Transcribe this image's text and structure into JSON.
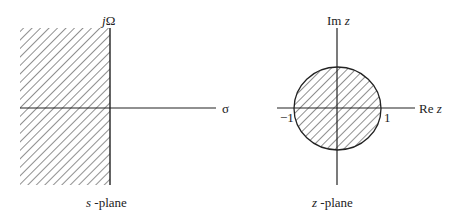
{
  "diagram": {
    "s_plane": {
      "caption_var": "s",
      "caption_text": " -plane",
      "vertical_axis_label_j": "j",
      "vertical_axis_label_omega": "Ω",
      "horizontal_axis_label": "σ",
      "shaded_region": "left half-plane"
    },
    "z_plane": {
      "caption_var": "z",
      "caption_text": " -plane",
      "vertical_axis_label_prefix": "Im ",
      "vertical_axis_label_var": "z",
      "horizontal_axis_label_prefix": "Re ",
      "horizontal_axis_label_var": "z",
      "tick_neg": "−1",
      "tick_pos": "1",
      "shaded_region": "interior of unit circle"
    },
    "colors": {
      "line": "#222222",
      "background": "#ffffff"
    }
  }
}
